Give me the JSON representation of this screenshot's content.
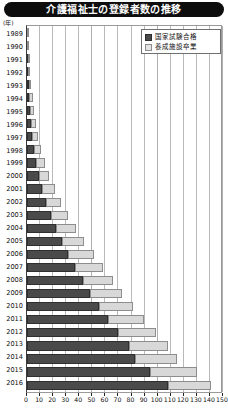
{
  "title": "介護福祉士の登録者数の推移",
  "axis": {
    "unit_label": "(年)",
    "x_ticks": [
      0,
      10,
      20,
      30,
      40,
      50,
      60,
      70,
      80,
      90,
      100,
      110,
      120,
      130,
      140,
      150
    ],
    "x_min": 0,
    "x_max": 150
  },
  "legend": {
    "items": [
      {
        "key": "exam",
        "label": "国家試験合格",
        "color": "#4a4a4a"
      },
      {
        "key": "school",
        "label": "養成施設卒業",
        "color": "#d8d8d8"
      }
    ]
  },
  "chart_data": {
    "type": "bar",
    "orientation": "horizontal",
    "stacked": true,
    "title": "介護福祉士の登録者数の推移",
    "xlabel": "",
    "ylabel": "(年)",
    "xlim": [
      0,
      150
    ],
    "grid": true,
    "legend_position": "top-right",
    "categories": [
      "1989",
      "1990",
      "1991",
      "1992",
      "1993",
      "1994",
      "1995",
      "1996",
      "1997",
      "1998",
      "1999",
      "2000",
      "2001",
      "2002",
      "2003",
      "2004",
      "2005",
      "2006",
      "2007",
      "2008",
      "2009",
      "2010",
      "2011",
      "2012",
      "2013",
      "2014",
      "2015",
      "2016"
    ],
    "series": [
      {
        "name": "国家試験合格",
        "color": "#4a4a4a",
        "values": [
          0,
          0.3,
          0.6,
          0.9,
          1.3,
          1.8,
          2.4,
          3.2,
          4.2,
          5.4,
          7.0,
          9.0,
          11.5,
          14.5,
          18.0,
          22.0,
          26.5,
          31.5,
          37.0,
          42.5,
          48.5,
          55.0,
          62.0,
          70.0,
          78.0,
          83.0,
          94.0,
          108.0
        ]
      },
      {
        "name": "養成施設卒業",
        "color": "#d8d8d8",
        "values": [
          0.6,
          0.9,
          1.2,
          1.6,
          2.0,
          2.5,
          3.1,
          3.8,
          4.6,
          5.6,
          6.8,
          8.2,
          9.8,
          11.5,
          13.5,
          15.5,
          17.5,
          19.5,
          21.5,
          23.0,
          24.5,
          26.0,
          27.5,
          29.0,
          30.0,
          32.0,
          36.0,
          33.0
        ]
      }
    ],
    "totals": [
      0.6,
      1.2,
      1.8,
      2.5,
      3.3,
      4.3,
      5.5,
      7.0,
      8.8,
      11.0,
      13.8,
      17.2,
      21.3,
      26.0,
      31.5,
      37.5,
      44.0,
      51.0,
      58.5,
      65.5,
      73.0,
      81.0,
      89.5,
      99.0,
      108.0,
      115.0,
      130.0,
      141.0
    ]
  }
}
